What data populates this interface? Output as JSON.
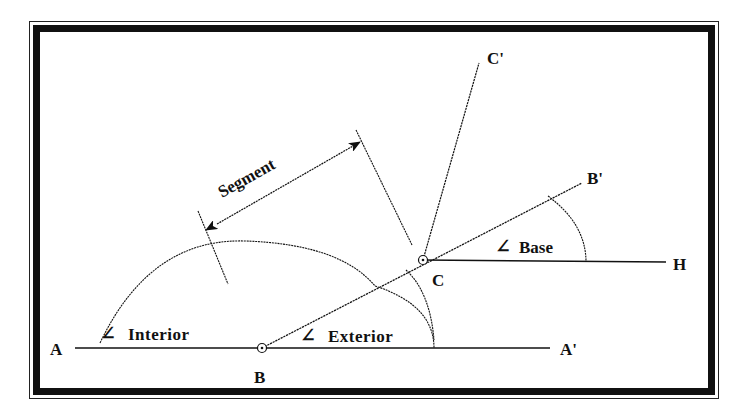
{
  "diagram": {
    "type": "geometry-angles",
    "points": {
      "A": {
        "label": "A",
        "x": 60,
        "y": 348
      },
      "A_prime": {
        "label": "A'",
        "x": 570,
        "y": 348
      },
      "B": {
        "label": "B",
        "x": 262,
        "y": 348
      },
      "C": {
        "label": "C",
        "x": 423,
        "y": 260
      },
      "B_prime": {
        "label": "B'",
        "x": 590,
        "y": 178
      },
      "C_prime": {
        "label": "C'",
        "x": 480,
        "y": 62
      },
      "H": {
        "label": "H",
        "x": 680,
        "y": 262
      }
    },
    "labels": {
      "segment": "Segment",
      "interior": "Interior",
      "exterior": "Exterior",
      "base": "Base",
      "angle_symbol": "∠"
    },
    "colors": {
      "ink": "#111111",
      "background": "#ffffff"
    }
  }
}
